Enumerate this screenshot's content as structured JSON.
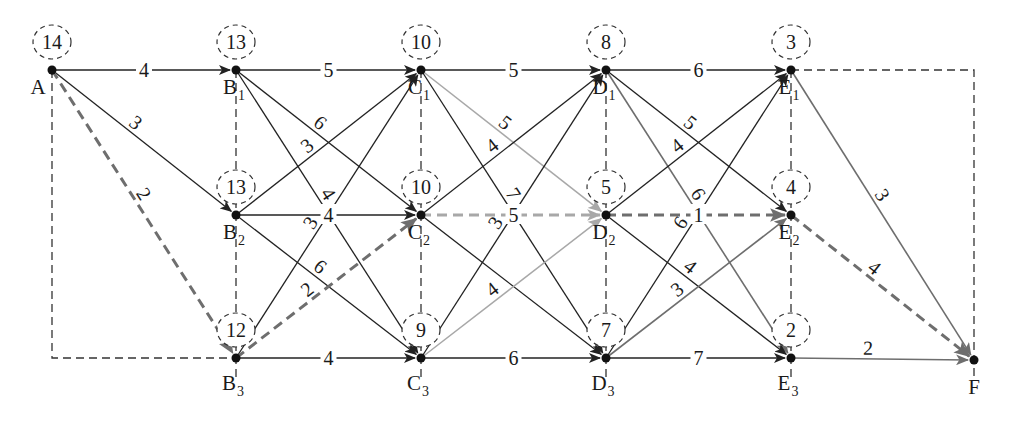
{
  "colors": {
    "normal_edge": "#222222",
    "optimal_edge": "#6e6e6e",
    "light_edge": "#a8a8a8",
    "grid_dashed": "#333333",
    "node": "#111111"
  },
  "nodes": [
    {
      "id": "A",
      "label": "A",
      "sub": "",
      "value": "14",
      "x": 52,
      "y": 70
    },
    {
      "id": "B1",
      "label": "B",
      "sub": "1",
      "value": "13",
      "x": 236,
      "y": 70
    },
    {
      "id": "B2",
      "label": "B",
      "sub": "2",
      "value": "13",
      "x": 236,
      "y": 215
    },
    {
      "id": "B3",
      "label": "B",
      "sub": "3",
      "value": "12",
      "x": 236,
      "y": 358
    },
    {
      "id": "C1",
      "label": "C",
      "sub": "1",
      "value": "10",
      "x": 421,
      "y": 70
    },
    {
      "id": "C2",
      "label": "C",
      "sub": "2",
      "value": "10",
      "x": 421,
      "y": 215
    },
    {
      "id": "C3",
      "label": "C",
      "sub": "3",
      "value": "9",
      "x": 421,
      "y": 358
    },
    {
      "id": "D1",
      "label": "D",
      "sub": "1",
      "value": "8",
      "x": 606,
      "y": 70
    },
    {
      "id": "D2",
      "label": "D",
      "sub": "2",
      "value": "5",
      "x": 606,
      "y": 215
    },
    {
      "id": "D3",
      "label": "D",
      "sub": "3",
      "value": "7",
      "x": 606,
      "y": 358
    },
    {
      "id": "E1",
      "label": "E",
      "sub": "1",
      "value": "3",
      "x": 791,
      "y": 70
    },
    {
      "id": "E2",
      "label": "E",
      "sub": "2",
      "value": "4",
      "x": 791,
      "y": 215
    },
    {
      "id": "E3",
      "label": "E",
      "sub": "3",
      "value": "2",
      "x": 791,
      "y": 358
    },
    {
      "id": "F",
      "label": "F",
      "sub": "",
      "value": "",
      "x": 974,
      "y": 360
    }
  ],
  "edges": [
    {
      "from": "A",
      "to": "B1",
      "weight": "4",
      "style": "normal"
    },
    {
      "from": "A",
      "to": "B2",
      "weight": "3",
      "style": "normal"
    },
    {
      "from": "A",
      "to": "B3",
      "weight": "2",
      "style": "optimal"
    },
    {
      "from": "B1",
      "to": "C1",
      "weight": "5",
      "style": "normal"
    },
    {
      "from": "B1",
      "to": "C2",
      "weight": "6",
      "style": "normal"
    },
    {
      "from": "B1",
      "to": "C3",
      "weight": "4",
      "style": "normal"
    },
    {
      "from": "B2",
      "to": "C1",
      "weight": "3",
      "style": "normal"
    },
    {
      "from": "B2",
      "to": "C2",
      "weight": "4",
      "style": "normal"
    },
    {
      "from": "B2",
      "to": "C3",
      "weight": "6",
      "style": "normal"
    },
    {
      "from": "B3",
      "to": "C1",
      "weight": "3",
      "style": "normal"
    },
    {
      "from": "B3",
      "to": "C2",
      "weight": "2",
      "style": "optimal"
    },
    {
      "from": "B3",
      "to": "C3",
      "weight": "4",
      "style": "normal"
    },
    {
      "from": "C1",
      "to": "D1",
      "weight": "5",
      "style": "normal"
    },
    {
      "from": "C1",
      "to": "D2",
      "weight": "5",
      "style": "light"
    },
    {
      "from": "C1",
      "to": "D3",
      "weight": "7",
      "style": "normal"
    },
    {
      "from": "C2",
      "to": "D1",
      "weight": "4",
      "style": "normal"
    },
    {
      "from": "C2",
      "to": "D2",
      "weight": "5",
      "style": "light-dashed"
    },
    {
      "from": "C2",
      "to": "D3",
      "weight": "",
      "style": "normal"
    },
    {
      "from": "C3",
      "to": "D1",
      "weight": "3",
      "style": "normal"
    },
    {
      "from": "C3",
      "to": "D2",
      "weight": "4",
      "style": "light"
    },
    {
      "from": "C3",
      "to": "D3",
      "weight": "6",
      "style": "normal"
    },
    {
      "from": "D1",
      "to": "E1",
      "weight": "6",
      "style": "normal"
    },
    {
      "from": "D1",
      "to": "E2",
      "weight": "5",
      "style": "normal"
    },
    {
      "from": "D1",
      "to": "E3",
      "weight": "6",
      "style": "gray"
    },
    {
      "from": "D2",
      "to": "E1",
      "weight": "4",
      "style": "normal"
    },
    {
      "from": "D2",
      "to": "E2",
      "weight": "1",
      "style": "optimal"
    },
    {
      "from": "D2",
      "to": "E3",
      "weight": "4",
      "style": "normal"
    },
    {
      "from": "D3",
      "to": "E1",
      "weight": "6",
      "style": "normal"
    },
    {
      "from": "D3",
      "to": "E2",
      "weight": "3",
      "style": "gray"
    },
    {
      "from": "D3",
      "to": "E3",
      "weight": "7",
      "style": "normal"
    },
    {
      "from": "E1",
      "to": "F",
      "weight": "3",
      "style": "gray"
    },
    {
      "from": "E2",
      "to": "F",
      "weight": "4",
      "style": "optimal"
    },
    {
      "from": "E3",
      "to": "F",
      "weight": "2",
      "style": "gray"
    }
  ],
  "optimal_path": [
    "A",
    "B3",
    "C2",
    "D2",
    "E2",
    "F"
  ],
  "optimal_length": "14"
}
